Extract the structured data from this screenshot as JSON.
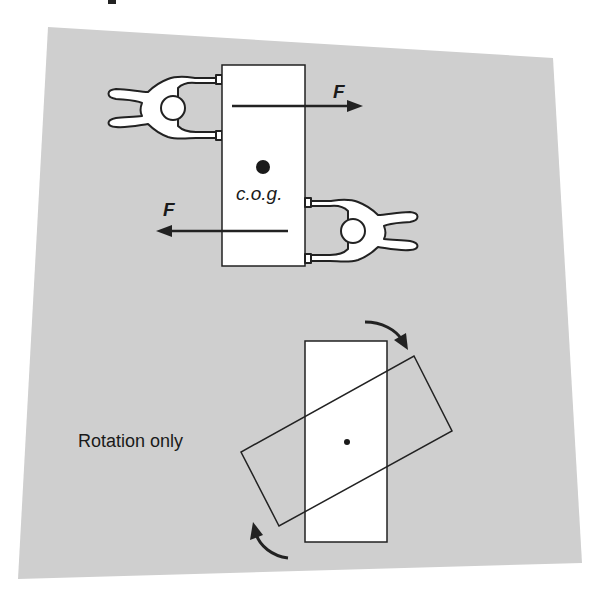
{
  "colors": {
    "background": "#ffffff",
    "panel": "#cfcfcf",
    "stroke": "#222222",
    "fill_white": "#ffffff"
  },
  "top_diagram": {
    "label_force_upper": "F",
    "label_force_lower": "F",
    "label_cog": "c.o.g.",
    "people": [
      {
        "id": "person-left",
        "facing": "right",
        "pushes": "upper end of box to the right"
      },
      {
        "id": "person-right",
        "facing": "left",
        "pushes": "lower end of box to the left"
      }
    ]
  },
  "bottom_diagram": {
    "label": "Rotation only",
    "arrows": [
      "clockwise arc top-right",
      "clockwise arc bottom-left"
    ]
  }
}
